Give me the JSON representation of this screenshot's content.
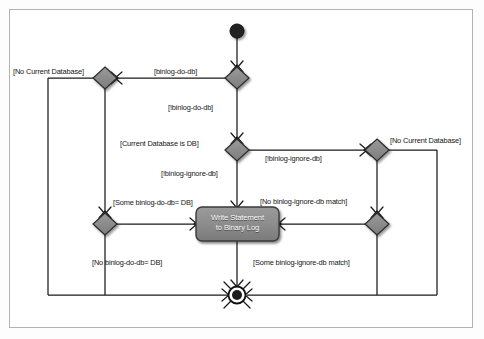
{
  "diagram": {
    "type": "uml-activity-diagram",
    "nodes": {
      "start": {
        "name": "initial-node",
        "x": 237,
        "y": 31
      },
      "final": {
        "name": "final-node",
        "x": 237,
        "y": 295
      },
      "activity": {
        "name": "write-statement-activity",
        "line1": "Write Statement",
        "line2": "to Binary Log",
        "x": 237,
        "y": 224
      },
      "decisions": [
        {
          "id": "d-binlog-do-db",
          "x": 237,
          "y": 78
        },
        {
          "id": "d-no-current-database-left",
          "x": 105,
          "y": 78
        },
        {
          "id": "d-current-database-is-db",
          "x": 237,
          "y": 150
        },
        {
          "id": "d-no-current-database-right",
          "x": 377,
          "y": 150
        },
        {
          "id": "d-some-binlog-do-db",
          "x": 105,
          "y": 224
        },
        {
          "id": "d-no-binlog-ignore-db-match",
          "x": 377,
          "y": 224
        }
      ]
    },
    "edge_labels": [
      {
        "id": "no-current-database-left",
        "text": "[No Current Database]",
        "x": 13,
        "y": 68
      },
      {
        "id": "binlog-do-db",
        "text": "[binlog-do-db]",
        "x": 154,
        "y": 68
      },
      {
        "id": "not-binlog-do-db",
        "text": "[!binlog-do-db]",
        "x": 168,
        "y": 104
      },
      {
        "id": "current-database-is-db",
        "text": "[Current Database is DB]",
        "x": 120,
        "y": 140
      },
      {
        "id": "not-binlog-ignore-db-right",
        "text": "[!binlog-ignore-db]",
        "x": 265,
        "y": 155
      },
      {
        "id": "no-current-database-right",
        "text": "[No Current Database]",
        "x": 390,
        "y": 137
      },
      {
        "id": "not-binlog-ignore-db-down",
        "text": "[!binlog-ignore-db]",
        "x": 161,
        "y": 170
      },
      {
        "id": "some-binlog-do-db-eq-db",
        "text": "[Some binlog-do-db= DB]",
        "x": 113,
        "y": 199
      },
      {
        "id": "no-binlog-ignore-db-match",
        "text": "[No binlog-ignore-db match]",
        "x": 260,
        "y": 198
      },
      {
        "id": "no-binlog-do-db-eq-db",
        "text": "[No binlog-do-db= DB]",
        "x": 92,
        "y": 259
      },
      {
        "id": "some-binlog-ignore-db-match",
        "text": "[Some binlog-ignore-db match]",
        "x": 253,
        "y": 259
      }
    ],
    "colors": {
      "node_fill": "#8a8a8a",
      "node_stroke": "#2b2b2b",
      "activity_fill": "#8c8c8c",
      "activity_stroke": "#3a3a3a",
      "activity_text": "#ffffff",
      "edge": "#1a1a1a",
      "frame": "#b3b3b3",
      "background": "#ffffff"
    }
  }
}
